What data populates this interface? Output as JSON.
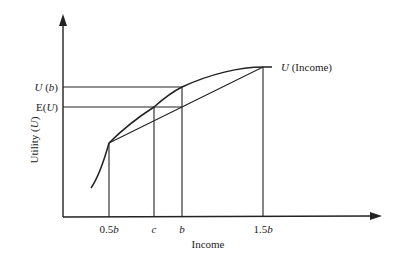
{
  "diagram": {
    "type": "utility-function-risk-aversion",
    "axes": {
      "x_label": "Income",
      "y_label": "Utility (U)",
      "y_label_parts": {
        "pre": "Utility (",
        "var": "U",
        "post": ")"
      }
    },
    "curve_label": {
      "var": "U",
      "rest": " (Income)"
    },
    "x_ticks": [
      {
        "label_num": "0.5",
        "label_var": "b"
      },
      {
        "label_num": "",
        "label_var": "c"
      },
      {
        "label_num": "",
        "label_var": "b"
      },
      {
        "label_num": "1.5",
        "label_var": "b"
      }
    ],
    "y_ticks": [
      {
        "pre": "",
        "var": "U",
        "mid": " (",
        "var2": "b",
        "post": ")"
      },
      {
        "pre": "E(",
        "var": "U",
        "mid": "",
        "var2": "",
        "post": ")"
      }
    ],
    "colors": {
      "line": "#222222",
      "background": "#ffffff"
    }
  }
}
